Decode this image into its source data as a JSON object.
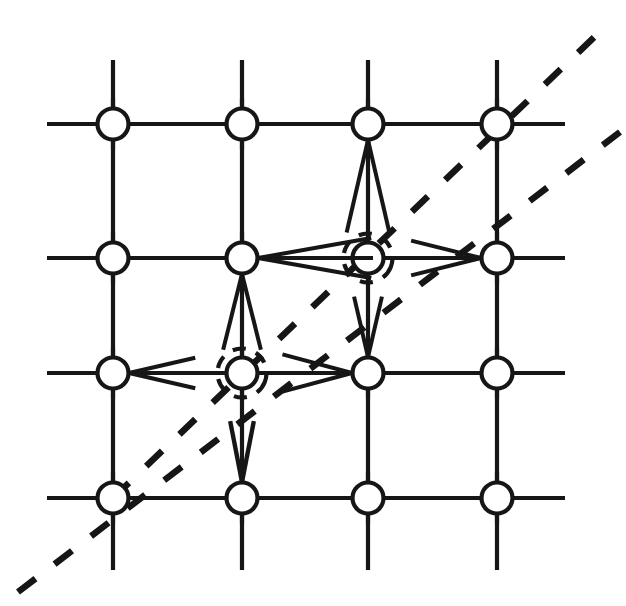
{
  "figure": {
    "background_color": "#ffffff",
    "ink_color": "#161616",
    "width": 626,
    "height": 606
  },
  "lattice": {
    "columns": 4,
    "rows": 4,
    "column_x": [
      113,
      242,
      368,
      497
    ],
    "row_y": [
      124,
      258,
      373,
      498
    ],
    "horizontal_line_extent": [
      47,
      565
    ],
    "vertical_line_extent": [
      60,
      570
    ],
    "grid_stroke_width": 4.2,
    "node_radius": 15.5,
    "node_stroke_width": 4.2
  },
  "nodes": [
    {
      "id": "n-c1-r1",
      "label": "node-col1-row1",
      "col": 1,
      "row": 1,
      "x": 113,
      "y": 124,
      "halo": false
    },
    {
      "id": "n-c2-r1",
      "label": "node-col2-row1",
      "col": 2,
      "row": 1,
      "x": 242,
      "y": 124,
      "halo": false
    },
    {
      "id": "n-c3-r1",
      "label": "node-col3-row1",
      "col": 3,
      "row": 1,
      "x": 368,
      "y": 124,
      "halo": false
    },
    {
      "id": "n-c4-r1",
      "label": "node-col4-row1",
      "col": 4,
      "row": 1,
      "x": 497,
      "y": 124,
      "halo": false
    },
    {
      "id": "n-c1-r2",
      "label": "node-col1-row2",
      "col": 1,
      "row": 2,
      "x": 113,
      "y": 258,
      "halo": false
    },
    {
      "id": "n-c2-r2",
      "label": "node-col2-row2",
      "col": 2,
      "row": 2,
      "x": 242,
      "y": 258,
      "halo": false
    },
    {
      "id": "n-c3-r2",
      "label": "node-col3-row2",
      "col": 3,
      "row": 2,
      "x": 368,
      "y": 258,
      "halo": true
    },
    {
      "id": "n-c4-r2",
      "label": "node-col4-row2",
      "col": 4,
      "row": 2,
      "x": 497,
      "y": 258,
      "halo": false
    },
    {
      "id": "n-c1-r3",
      "label": "node-col1-row3",
      "col": 1,
      "row": 3,
      "x": 113,
      "y": 373,
      "halo": false
    },
    {
      "id": "n-c2-r3",
      "label": "node-col2-row3",
      "col": 2,
      "row": 3,
      "x": 242,
      "y": 373,
      "halo": true
    },
    {
      "id": "n-c3-r3",
      "label": "node-col3-row3",
      "col": 3,
      "row": 3,
      "x": 368,
      "y": 373,
      "halo": false
    },
    {
      "id": "n-c4-r3",
      "label": "node-col4-row3",
      "col": 4,
      "row": 3,
      "x": 497,
      "y": 373,
      "halo": false
    },
    {
      "id": "n-c1-r4",
      "label": "node-col1-row4",
      "col": 1,
      "row": 4,
      "x": 113,
      "y": 498,
      "halo": false
    },
    {
      "id": "n-c2-r4",
      "label": "node-col2-row4",
      "col": 2,
      "row": 4,
      "x": 242,
      "y": 498,
      "halo": false
    },
    {
      "id": "n-c3-r4",
      "label": "node-col3-row4",
      "col": 3,
      "row": 4,
      "x": 368,
      "y": 498,
      "halo": false
    },
    {
      "id": "n-c4-r4",
      "label": "node-col4-row4",
      "col": 4,
      "row": 4,
      "x": 497,
      "y": 498,
      "halo": false
    }
  ],
  "arrow_fans": [
    {
      "id": "fan-to-c3r1-from-below",
      "label": "arrow-fan-into-node-col3-row1-from-below",
      "target_node": "n-c3-r1",
      "tip_x": 368,
      "tip_y": 140,
      "direction": "up",
      "length": 95,
      "spread_degrees": 13,
      "line_count": 3,
      "stroke_width": 4.0
    },
    {
      "id": "fan-to-c2r2-from-right",
      "label": "arrow-fan-into-node-col2-row2-from-right",
      "target_node": "n-c2-r2",
      "tip_x": 258,
      "tip_y": 258,
      "direction": "left",
      "length": 115,
      "spread_degrees": 10,
      "line_count": 3,
      "stroke_width": 4.0
    },
    {
      "id": "fan-to-c2r2-from-below",
      "label": "arrow-fan-into-node-col2-row2-from-below",
      "target_node": "n-c2-r2",
      "tip_x": 242,
      "tip_y": 274,
      "direction": "up",
      "length": 78,
      "spread_degrees": 14,
      "line_count": 3,
      "stroke_width": 4.0
    },
    {
      "id": "fan-to-c4r2-from-left",
      "label": "arrow-fan-into-node-col4-row2-from-left",
      "target_node": "n-c4-r2",
      "tip_x": 481,
      "tip_y": 258,
      "direction": "right",
      "length": 72,
      "spread_degrees": 14,
      "line_count": 3,
      "stroke_width": 4.0
    },
    {
      "id": "fan-to-c1r3-from-right",
      "label": "arrow-fan-into-node-col1-row3-from-right",
      "target_node": "n-c1-r3",
      "tip_x": 129,
      "tip_y": 373,
      "direction": "left",
      "length": 68,
      "spread_degrees": 13,
      "line_count": 3,
      "stroke_width": 4.0
    },
    {
      "id": "fan-to-c3r3-from-left",
      "label": "arrow-fan-into-node-col3-row3-from-left",
      "target_node": "n-c3-r3",
      "tip_x": 352,
      "tip_y": 373,
      "direction": "right",
      "length": 72,
      "spread_degrees": 15,
      "line_count": 3,
      "stroke_width": 4.0
    },
    {
      "id": "fan-to-c3r3-from-above",
      "label": "arrow-fan-into-node-col3-row3-from-above",
      "target_node": "n-c3-r3",
      "tip_x": 368,
      "tip_y": 357,
      "direction": "down",
      "length": 62,
      "spread_degrees": 13,
      "line_count": 3,
      "stroke_width": 4.0
    },
    {
      "id": "fan-to-c2r4-from-above",
      "label": "arrow-fan-into-node-col2-row4-from-above",
      "target_node": "n-c2-r4",
      "tip_x": 242,
      "tip_y": 482,
      "direction": "down",
      "length": 62,
      "spread_degrees": 11,
      "line_count": 2,
      "stroke_width": 4.4
    }
  ],
  "diagonals": [
    {
      "id": "diagonal-upper",
      "label": "dashed-diagonal-upper",
      "x1": 113,
      "y1": 498,
      "x2": 610,
      "y2": 22,
      "dash_pattern": "22 24",
      "stroke_width": 6.5,
      "style": "dashed"
    },
    {
      "id": "diagonal-lower",
      "label": "dashed-diagonal-lower",
      "x1": 18,
      "y1": 592,
      "x2": 620,
      "y2": 132,
      "dash_pattern": "22 24",
      "stroke_width": 6.5,
      "style": "dashed"
    }
  ]
}
